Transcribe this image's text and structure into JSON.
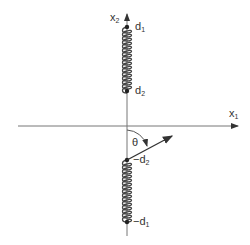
{
  "diagram": {
    "axes": {
      "x1": {
        "label": "x",
        "subscript": "1"
      },
      "x2": {
        "label": "x",
        "subscript": "2"
      }
    },
    "points": [
      {
        "id": "d1",
        "label": "d",
        "subscript": "1",
        "prefix": ""
      },
      {
        "id": "d2",
        "label": "d",
        "subscript": "2",
        "prefix": ""
      },
      {
        "id": "neg_d2",
        "label": "d",
        "subscript": "2",
        "prefix": "−"
      },
      {
        "id": "neg_d1",
        "label": "d",
        "subscript": "1",
        "prefix": "−"
      }
    ],
    "angle": {
      "label": "θ"
    },
    "colors": {
      "line": "#555555",
      "coil": "#444444",
      "text": "#333333"
    }
  }
}
